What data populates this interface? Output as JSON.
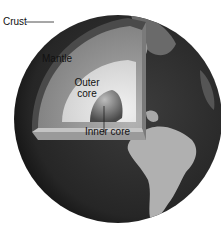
{
  "diagram": {
    "labels": {
      "crust": "Crust",
      "mantle": "Mantle",
      "outer_core_line1": "Outer",
      "outer_core_line2": "core",
      "inner_core": "Inner core"
    },
    "colors": {
      "background": "#ffffff",
      "globe_ocean": "#2e2e2e",
      "globe_land": "#b8b8b8",
      "crust": "#4a4a4a",
      "mantle": "#8e8e8e",
      "outer_core": "#d6d6d6",
      "inner_core": "#6a6a6a",
      "leader_line": "#222222"
    }
  }
}
